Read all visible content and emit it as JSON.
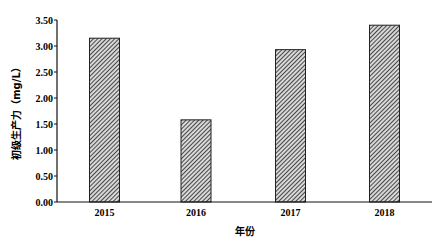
{
  "chart_data": {
    "type": "bar",
    "title": "",
    "xlabel": "年份",
    "ylabel": "初级生产力（mg/L）",
    "categories": [
      "2015",
      "2016",
      "2017",
      "2018"
    ],
    "values": [
      3.15,
      1.58,
      2.93,
      3.4
    ],
    "ylim": [
      0,
      3.5
    ],
    "yticks": [
      "0.00",
      "0.50",
      "1.00",
      "1.50",
      "2.00",
      "2.50",
      "3.00",
      "3.50"
    ],
    "grid": false,
    "legend": null,
    "bar_style": "diagonal-hatch",
    "bar_color": "#555555"
  }
}
